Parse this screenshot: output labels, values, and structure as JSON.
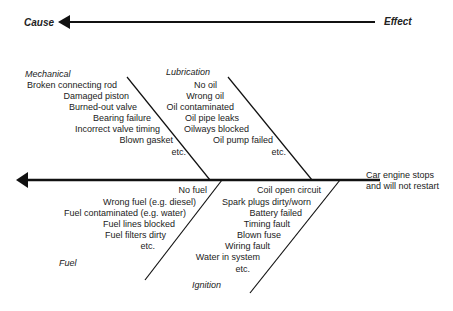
{
  "header": {
    "cause_label": "Cause",
    "effect_label": "Effect"
  },
  "effect": {
    "line1": "Car engine stops",
    "line2": "and will not restart"
  },
  "categories": {
    "mechanical": {
      "title": "Mechanical",
      "items": [
        "Broken connecting rod",
        "Damaged piston",
        "Burned-out valve",
        "Bearing failure",
        "Incorrect valve timing",
        "Blown gasket",
        "etc."
      ]
    },
    "lubrication": {
      "title": "Lubrication",
      "items": [
        "No oil",
        "Wrong oil",
        "Oil contaminated",
        "Oil pipe leaks",
        "Oilways blocked",
        "Oil pump failed",
        "etc."
      ]
    },
    "fuel": {
      "title": "Fuel",
      "items": [
        "No fuel",
        "Wrong fuel (e.g. diesel)",
        "Fuel contaminated (e.g. water)",
        "Fuel lines blocked",
        "Fuel filters dirty",
        "etc."
      ]
    },
    "ignition": {
      "title": "Ignition",
      "items": [
        "Coil open circuit",
        "Spark plugs dirty/worn",
        "Battery failed",
        "Timing fault",
        "Blown fuse",
        "Wiring fault",
        "Water in system",
        "etc."
      ]
    }
  }
}
